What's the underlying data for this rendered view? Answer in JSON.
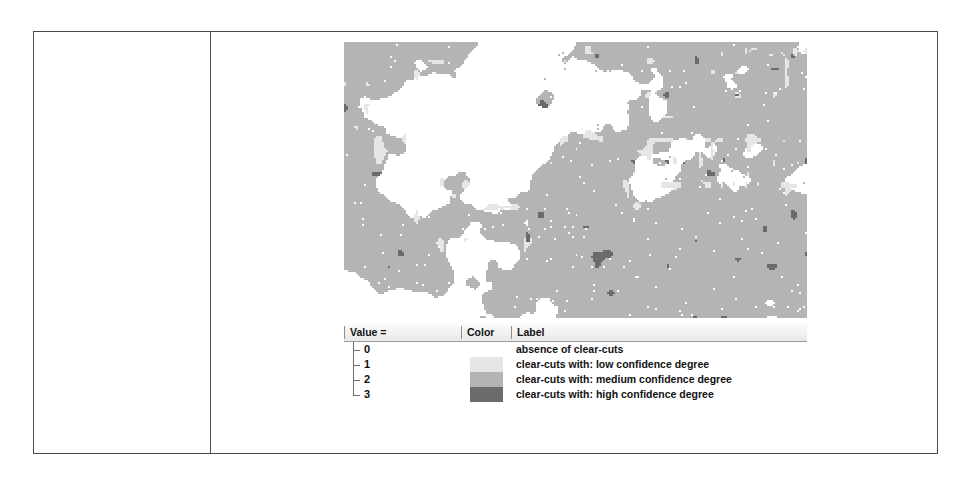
{
  "figure": {
    "caption_cell_text": "",
    "map": {
      "alt_name": "clear-cuts classification raster map",
      "background_color": "#ffffff"
    }
  },
  "legend": {
    "headers": {
      "value": "Value =",
      "color": "Color",
      "label": "Label"
    },
    "rows": [
      {
        "value": "0",
        "color": "#ffffff",
        "label": "absence of clear-cuts"
      },
      {
        "value": "1",
        "color": "#e6e6e6",
        "label": "clear-cuts with: low confidence degree"
      },
      {
        "value": "2",
        "color": "#b4b4b4",
        "label": "clear-cuts with: medium confidence degree"
      },
      {
        "value": "3",
        "color": "#6b6b6b",
        "label": "clear-cuts with: high confidence degree"
      }
    ]
  },
  "chart_data": {
    "type": "heatmap",
    "title": "",
    "xlabel": "",
    "ylabel": "",
    "legend_position": "below",
    "grid": false,
    "classes": [
      {
        "value": 0,
        "color": "#ffffff",
        "label": "absence of clear-cuts",
        "approx_area_fraction": 0.42
      },
      {
        "value": 1,
        "color": "#e6e6e6",
        "label": "clear-cuts with: low confidence degree",
        "approx_area_fraction": 0.08
      },
      {
        "value": 2,
        "color": "#b4b4b4",
        "label": "clear-cuts with: medium confidence degree",
        "approx_area_fraction": 0.45
      },
      {
        "value": 3,
        "color": "#6b6b6b",
        "label": "clear-cuts with: high confidence degree",
        "approx_area_fraction": 0.05
      }
    ]
  }
}
